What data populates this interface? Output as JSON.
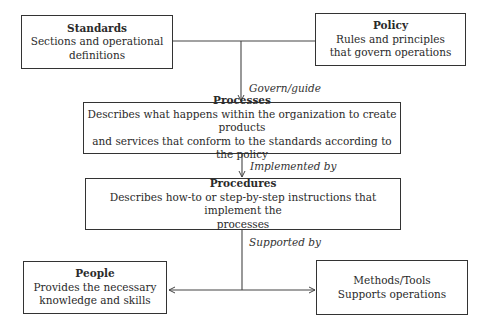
{
  "diagram": {
    "nodes": {
      "standards": {
        "title": "Standards",
        "line1": "Sections and operational",
        "line2": "definitions"
      },
      "policy": {
        "title": "Policy",
        "line1": "Rules and principles",
        "line2": "that govern operations"
      },
      "processes": {
        "title": "Processes",
        "line1": "Describes what happens within the organization to create products",
        "line2": "and services that conform to the standards according to the policy"
      },
      "procedures": {
        "title": "Procedures",
        "line1": "Describes how-to or step-by-step instructions that implement the",
        "line2": "processes"
      },
      "people": {
        "title": "People",
        "line1": "Provides the necessary",
        "line2": "knowledge and skills"
      },
      "methods_tools": {
        "line1": "Methods/Tools",
        "line2": "Supports operations"
      }
    },
    "edges": {
      "govern_guide": "Govern/guide",
      "implemented_by": "Implemented by",
      "supported_by": "Supported by"
    },
    "colors": {
      "line": "#444444",
      "text": "#2a2a2a",
      "background": "#ffffff"
    }
  }
}
